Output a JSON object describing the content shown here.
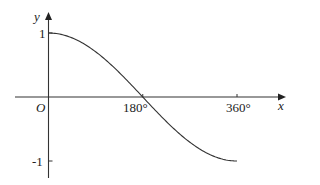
{
  "chart_data": {
    "type": "line",
    "title": "",
    "xlabel": "x",
    "ylabel": "y",
    "origin_label": "O",
    "x_ticks": [
      {
        "value": 180,
        "label": "180°"
      },
      {
        "value": 360,
        "label": "360°"
      }
    ],
    "y_ticks": [
      {
        "value": 1,
        "label": "1"
      },
      {
        "value": -1,
        "label": "-1"
      }
    ],
    "xlim": [
      0,
      360
    ],
    "ylim": [
      -1,
      1
    ],
    "grid": false,
    "legend": null,
    "series": [
      {
        "name": "y = cos(x/2)",
        "x": [
          0,
          30,
          60,
          90,
          120,
          150,
          180,
          210,
          240,
          270,
          300,
          330,
          360
        ],
        "values": [
          1.0,
          0.966,
          0.866,
          0.707,
          0.5,
          0.259,
          0.0,
          -0.259,
          -0.5,
          -0.707,
          -0.866,
          -0.966,
          -1.0
        ]
      }
    ]
  },
  "colors": {
    "axis": "#333333",
    "curve": "#333333",
    "background": "#ffffff"
  }
}
